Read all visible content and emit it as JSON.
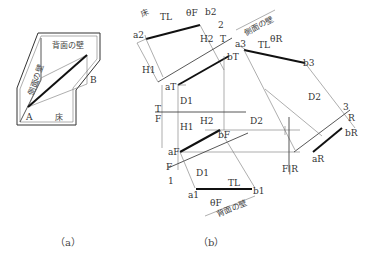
{
  "figure_a": {
    "caption": "（a）",
    "labels": {
      "back_wall": "背面の壁",
      "side_wall": "側面の壁",
      "floor": "床",
      "point_a": "A",
      "point_b": "B"
    }
  },
  "figure_b": {
    "caption": "（b）",
    "labels": {
      "floor": "床",
      "side_wall": "側面の壁",
      "back_wall": "背面の壁",
      "TL": "TL",
      "theta_F": "θF",
      "theta_R": "θR",
      "H1": "H1",
      "H2": "H2",
      "D1": "D1",
      "D2": "D2",
      "a2": "a2",
      "b2": "b2",
      "aT": "aT",
      "bT": "bT",
      "a3": "a3",
      "b3": "b3",
      "aF": "aF",
      "bF": "bF",
      "a1": "a1",
      "b1": "b1",
      "aR": "aR",
      "bR": "bR",
      "T": "T",
      "F": "F",
      "R": "R",
      "n1": "1",
      "n2": "2",
      "n3": "3",
      "fold_TF_top": "T",
      "fold_TF_bottom": "F",
      "fold_FR": "F|R"
    }
  }
}
